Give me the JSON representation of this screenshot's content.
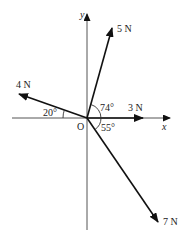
{
  "diagram": {
    "type": "force-vector-diagram",
    "origin_label": "O",
    "axes": {
      "x_label": "x",
      "y_label": "y"
    },
    "forces": [
      {
        "id": "f5",
        "label": "5 N",
        "magnitude": 5,
        "angle_label": "74°",
        "angle_ref": "from positive x-axis, counter-clockwise"
      },
      {
        "id": "f4",
        "label": "4 N",
        "magnitude": 4,
        "angle_label": "20°",
        "angle_ref": "above negative x-axis"
      },
      {
        "id": "f3",
        "label": "3 N",
        "magnitude": 3,
        "angle_label": "",
        "angle_ref": "along positive x-axis"
      },
      {
        "id": "f7",
        "label": "7 N",
        "magnitude": 7,
        "angle_label": "55°",
        "angle_ref": "below positive x-axis"
      }
    ],
    "colors": {
      "axis": "#555555",
      "vector": "#111111",
      "text": "#222222"
    }
  }
}
